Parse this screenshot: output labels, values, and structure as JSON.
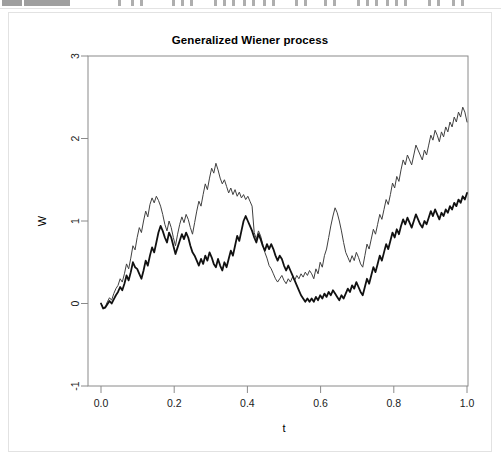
{
  "toolbar": {
    "description": "cut-off application toolbar row",
    "blocks": [
      {
        "x": 2,
        "w": 20
      },
      {
        "x": 24,
        "w": 46
      }
    ],
    "ticks": [
      {
        "x": 118
      },
      {
        "x": 131
      },
      {
        "x": 140
      },
      {
        "x": 172
      },
      {
        "x": 181
      },
      {
        "x": 190
      },
      {
        "x": 214
      },
      {
        "x": 223
      },
      {
        "x": 232
      },
      {
        "x": 243
      },
      {
        "x": 252
      },
      {
        "x": 263
      },
      {
        "x": 272
      },
      {
        "x": 295
      },
      {
        "x": 304
      },
      {
        "x": 324
      },
      {
        "x": 333
      },
      {
        "x": 357
      },
      {
        "x": 366
      },
      {
        "x": 375
      },
      {
        "x": 386
      },
      {
        "x": 395
      },
      {
        "x": 404
      },
      {
        "x": 428
      },
      {
        "x": 437
      },
      {
        "x": 452
      },
      {
        "x": 461
      }
    ]
  },
  "chart_data": {
    "type": "line",
    "title": "Generalized Wiener process",
    "xlabel": "t",
    "ylabel": "W",
    "xlim": [
      0.0,
      1.0
    ],
    "ylim": [
      -1,
      3
    ],
    "grid": false,
    "legend": null,
    "xticks": [
      "0.0",
      "0.2",
      "0.4",
      "0.6",
      "0.8",
      "1.0"
    ],
    "xtick_values": [
      0.0,
      0.2,
      0.4,
      0.6,
      0.8,
      1.0
    ],
    "yticks": [
      "-1",
      "0",
      "1",
      "2",
      "3"
    ],
    "ytick_values": [
      -1,
      0,
      1,
      2,
      3
    ],
    "box": true,
    "series": [
      {
        "name": "upper-path",
        "color": "#404040",
        "width": 1.0,
        "values": [
          0.0,
          -0.05,
          -0.04,
          0.02,
          0.07,
          0.04,
          0.12,
          0.18,
          0.22,
          0.3,
          0.26,
          0.36,
          0.48,
          0.42,
          0.55,
          0.7,
          0.65,
          0.8,
          0.92,
          0.86,
          1.0,
          1.12,
          1.05,
          1.2,
          1.28,
          1.22,
          1.3,
          1.25,
          1.18,
          1.08,
          0.96,
          0.88,
          1.0,
          0.92,
          0.8,
          0.7,
          0.84,
          0.96,
          1.05,
          0.98,
          1.08,
          1.02,
          0.92,
          0.84,
          0.98,
          1.12,
          1.24,
          1.18,
          1.32,
          1.45,
          1.38,
          1.52,
          1.64,
          1.58,
          1.7,
          1.62,
          1.52,
          1.45,
          1.5,
          1.42,
          1.34,
          1.4,
          1.32,
          1.38,
          1.3,
          1.35,
          1.28,
          1.32,
          1.26,
          1.3,
          1.24,
          1.18,
          0.86,
          0.78,
          0.88,
          0.82,
          0.72,
          0.62,
          0.55,
          0.46,
          0.42,
          0.36,
          0.3,
          0.26,
          0.3,
          0.34,
          0.28,
          0.24,
          0.3,
          0.26,
          0.32,
          0.28,
          0.34,
          0.3,
          0.36,
          0.32,
          0.38,
          0.34,
          0.4,
          0.36,
          0.3,
          0.42,
          0.36,
          0.5,
          0.44,
          0.58,
          0.66,
          0.8,
          0.94,
          1.06,
          1.16,
          1.1,
          1.0,
          0.88,
          0.74,
          0.62,
          0.56,
          0.5,
          0.58,
          0.52,
          0.62,
          0.56,
          0.48,
          0.44,
          0.58,
          0.72,
          0.66,
          0.78,
          0.9,
          0.84,
          0.96,
          1.08,
          1.02,
          1.14,
          1.26,
          1.2,
          1.32,
          1.46,
          1.4,
          1.54,
          1.48,
          1.62,
          1.74,
          1.68,
          1.8,
          1.74,
          1.68,
          1.8,
          1.92,
          1.86,
          1.8,
          1.74,
          1.86,
          1.8,
          1.92,
          2.04,
          1.98,
          2.1,
          2.04,
          1.96,
          2.08,
          2.02,
          2.14,
          2.08,
          2.2,
          2.14,
          2.26,
          2.2,
          2.32,
          2.26,
          2.38,
          2.32,
          2.2
        ]
      },
      {
        "name": "lower-path",
        "color": "#111111",
        "width": 1.8,
        "values": [
          0.0,
          -0.06,
          -0.05,
          -0.01,
          0.03,
          0.0,
          0.05,
          0.1,
          0.14,
          0.2,
          0.16,
          0.24,
          0.34,
          0.28,
          0.38,
          0.5,
          0.44,
          0.42,
          0.36,
          0.3,
          0.4,
          0.52,
          0.46,
          0.58,
          0.68,
          0.62,
          0.74,
          0.86,
          0.94,
          0.88,
          0.8,
          0.74,
          0.86,
          0.8,
          0.7,
          0.6,
          0.68,
          0.76,
          0.84,
          0.78,
          0.86,
          0.8,
          0.7,
          0.62,
          0.58,
          0.52,
          0.46,
          0.54,
          0.48,
          0.58,
          0.52,
          0.62,
          0.56,
          0.48,
          0.44,
          0.54,
          0.46,
          0.4,
          0.5,
          0.44,
          0.54,
          0.64,
          0.58,
          0.7,
          0.82,
          0.76,
          0.88,
          1.0,
          1.06,
          1.0,
          0.94,
          0.88,
          0.8,
          0.74,
          0.84,
          0.78,
          0.7,
          0.64,
          0.72,
          0.66,
          0.72,
          0.66,
          0.58,
          0.52,
          0.58,
          0.54,
          0.46,
          0.4,
          0.46,
          0.4,
          0.34,
          0.28,
          0.22,
          0.16,
          0.1,
          0.06,
          0.02,
          0.06,
          0.02,
          0.06,
          0.02,
          0.08,
          0.04,
          0.1,
          0.06,
          0.12,
          0.08,
          0.14,
          0.1,
          0.16,
          0.12,
          0.08,
          0.04,
          0.1,
          0.06,
          0.12,
          0.18,
          0.14,
          0.22,
          0.18,
          0.26,
          0.2,
          0.14,
          0.1,
          0.2,
          0.3,
          0.24,
          0.34,
          0.44,
          0.38,
          0.48,
          0.58,
          0.52,
          0.62,
          0.72,
          0.66,
          0.76,
          0.86,
          0.8,
          0.9,
          0.84,
          0.94,
          1.02,
          0.96,
          1.04,
          0.98,
          0.92,
          1.0,
          1.08,
          1.02,
          0.96,
          0.92,
          1.0,
          0.96,
          1.04,
          1.12,
          1.06,
          1.14,
          1.08,
          1.02,
          1.1,
          1.06,
          1.14,
          1.1,
          1.18,
          1.14,
          1.22,
          1.18,
          1.26,
          1.22,
          1.3,
          1.26,
          1.34
        ]
      }
    ]
  }
}
